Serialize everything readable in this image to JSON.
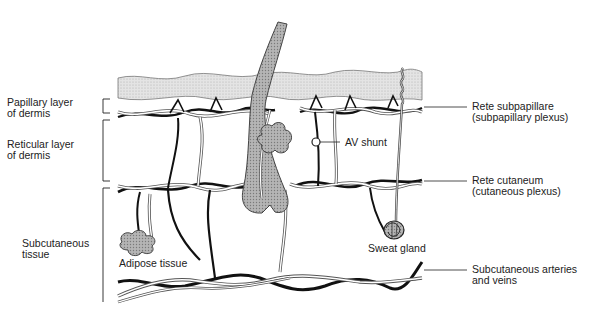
{
  "diagram": {
    "left_labels": [
      {
        "id": "papillary",
        "line1": "Papillary layer",
        "line2": "of dermis"
      },
      {
        "id": "reticular",
        "line1": "Reticular layer",
        "line2": "of dermis"
      },
      {
        "id": "subcutaneous",
        "line1": "Subcutaneous",
        "line2": "tissue"
      }
    ],
    "right_labels": [
      {
        "id": "rete-subpapillare",
        "line1": "Rete subpapillare",
        "line2": "(subpapillary plexus)"
      },
      {
        "id": "rete-cutaneum",
        "line1": "Rete cutaneum",
        "line2": "(cutaneous plexus)"
      },
      {
        "id": "subcutaneous-vessels",
        "line1": "Subcutaneous arteries",
        "line2": "and veins"
      }
    ],
    "inline_labels": {
      "av_shunt": "AV shunt",
      "adipose": "Adipose tissue",
      "sweat_gland": "Sweat gland"
    },
    "colors": {
      "epidermis_fill": "#d9d9d9",
      "tissue_fill": "#a8a8a8",
      "vessel_dark": "#111111",
      "vessel_light_outline": "#555555",
      "text": "#222222"
    }
  }
}
